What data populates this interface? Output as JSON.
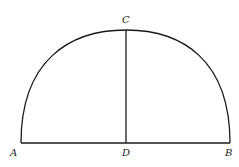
{
  "figure": {
    "stroke_color": "#1a1a1a",
    "points": {
      "A": {
        "label": "A",
        "x": 21,
        "y": 143
      },
      "B": {
        "label": "B",
        "x": 230,
        "y": 143
      },
      "C": {
        "label": "C",
        "x": 126,
        "y": 30
      },
      "D": {
        "label": "D",
        "x": 126,
        "y": 143
      }
    },
    "segments": [
      "AB",
      "CD"
    ],
    "arc": "A-C-B"
  }
}
